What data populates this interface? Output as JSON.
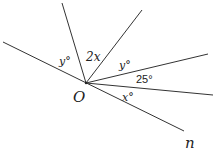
{
  "diagram": {
    "type": "angles-at-a-point",
    "vertex": {
      "label": "O",
      "x": 86,
      "y": 83
    },
    "line_end_label": "n",
    "rays": [
      {
        "name": "left-line",
        "x1": 3,
        "y1": 42,
        "x2": 184,
        "y2": 131
      },
      {
        "name": "steep-ray",
        "x2": 62,
        "y2": 3
      },
      {
        "name": "upper-right-ray",
        "x2": 142,
        "y2": 10
      },
      {
        "name": "right-ray-1",
        "x2": 208,
        "y2": 54
      },
      {
        "name": "right-ray-2",
        "x2": 213,
        "y2": 95
      }
    ],
    "angles": [
      {
        "label": "y°",
        "x": 60,
        "y": 63
      },
      {
        "label": "2x",
        "x": 86,
        "y": 58
      },
      {
        "label": "y°",
        "x": 120,
        "y": 68
      },
      {
        "label": "25°",
        "x": 137,
        "y": 82
      },
      {
        "label": "x°",
        "x": 123,
        "y": 100
      }
    ]
  },
  "labels": {
    "vertex": "O",
    "line_end": "n",
    "angle_left": "y°",
    "angle_steep": "2x",
    "angle_upper_right": "y°",
    "angle_25": "25°",
    "angle_lower": "x°"
  }
}
